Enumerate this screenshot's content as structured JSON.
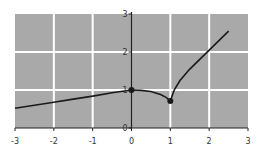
{
  "chart_data": {
    "type": "line",
    "title": "",
    "xlabel": "",
    "ylabel": "",
    "xlim": [
      -3,
      3
    ],
    "ylim": [
      0,
      3
    ],
    "grid": true,
    "xticks": [
      "-3",
      "-2",
      "-1",
      "0",
      "1",
      "2",
      "3"
    ],
    "yticks": [
      "0",
      "1",
      "2",
      "3"
    ],
    "series": [
      {
        "name": "f(x)",
        "x": [
          -3,
          -2.5,
          -2,
          -1.5,
          -1,
          -0.5,
          0,
          0.25,
          0.5,
          0.75,
          0.9,
          1,
          1.1,
          1.25,
          1.5,
          1.75,
          2,
          2.25,
          2.5
        ],
        "y": [
          0.52,
          0.6,
          0.68,
          0.76,
          0.84,
          0.93,
          1.0,
          0.99,
          0.96,
          0.88,
          0.8,
          0.71,
          1.0,
          1.25,
          1.55,
          1.8,
          2.05,
          2.3,
          2.55
        ]
      }
    ],
    "points": [
      {
        "x": 0,
        "y": 1,
        "label": "filled dot"
      },
      {
        "x": 1,
        "y": 0.71,
        "label": "filled dot"
      }
    ],
    "colors": {
      "plot_bg": "#a9a9a9",
      "grid": "#ffffff",
      "line": "#1a1a1a",
      "axis": "#222222"
    }
  }
}
